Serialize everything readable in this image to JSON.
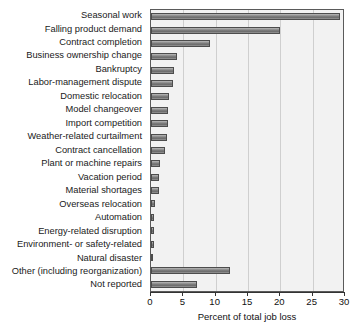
{
  "chart_data": {
    "type": "bar",
    "orientation": "horizontal",
    "title": "",
    "xlabel": "Percent of total job loss",
    "ylabel": "",
    "xlim": [
      0,
      30
    ],
    "xticks": [
      0,
      5,
      10,
      15,
      20,
      25,
      30
    ],
    "grid": true,
    "legend": null,
    "categories": [
      "Seasonal work",
      "Falling product demand",
      "Contract completion",
      "Business ownership change",
      "Bankruptcy",
      "Labor-management dispute",
      "Domestic relocation",
      "Model changeover",
      "Import competition",
      "Weather-related curtailment",
      "Contract cancellation",
      "Plant or machine repairs",
      "Vacation period",
      "Material shortages",
      "Overseas relocation",
      "Automation",
      "Energy-related disruption",
      "Environment- or safety-related",
      "Natural disaster",
      "Other (including reorganization)",
      "Not reported"
    ],
    "values": [
      29.2,
      19.9,
      9.1,
      4.0,
      3.6,
      3.4,
      2.8,
      2.6,
      2.7,
      2.4,
      2.1,
      1.4,
      1.3,
      1.2,
      0.6,
      0.5,
      0.5,
      0.4,
      0.3,
      12.2,
      7.1
    ],
    "colors": {
      "bar_fill": "#7d7d7d",
      "bar_edge": "#4d4d4d",
      "plot_background": "#f2f2f2",
      "grid_color": "#cfcfcf",
      "axis_color": "#333333",
      "text_color": "#111111"
    }
  }
}
